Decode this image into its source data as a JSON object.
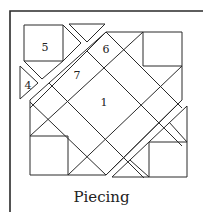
{
  "diagram": {
    "caption": "Piecing",
    "labels": [
      {
        "text": "5",
        "x": 45,
        "y": 50
      },
      {
        "text": "6",
        "x": 106,
        "y": 52
      },
      {
        "text": "7",
        "x": 77,
        "y": 78
      },
      {
        "text": "4",
        "x": 28,
        "y": 88
      },
      {
        "text": "1",
        "x": 104,
        "y": 105
      }
    ],
    "line_color": "#2a2a2a"
  }
}
